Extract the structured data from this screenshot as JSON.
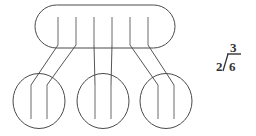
{
  "canvas": {
    "width": 256,
    "height": 136,
    "background_color": "#ffffff",
    "line_color": "#4a4a4a",
    "tally_color": "#6b6b6b",
    "text_color": "#333333"
  },
  "diagram": {
    "whole_group": {
      "shape": "stadium",
      "label": "whole-group",
      "tally_count": 6,
      "tally_marks": [
        "|",
        "|",
        "|",
        "|",
        "|",
        "|"
      ],
      "bounds": {
        "x": 35,
        "y": 5,
        "width": 140,
        "height": 43,
        "radius": 21.5
      },
      "tally_x_positions": [
        58,
        76,
        94,
        112,
        130,
        148
      ],
      "tally_y_top": 17,
      "tally_y_bottom": 45
    },
    "sub_groups": [
      {
        "label": "group-1",
        "shape": "circle",
        "tally_count": 2,
        "tally_marks": [
          "|",
          "|"
        ],
        "center_x": 39,
        "center_y": 101,
        "radius_x": 26,
        "radius_y": 27.5,
        "tally_x_positions": [
          31,
          47
        ],
        "tally_y_top": 85,
        "tally_y_bottom": 119
      },
      {
        "label": "group-2",
        "shape": "circle",
        "tally_count": 2,
        "tally_marks": [
          "|",
          "|"
        ],
        "center_x": 103,
        "center_y": 101,
        "radius_x": 26,
        "radius_y": 27.5,
        "tally_x_positions": [
          95,
          111
        ],
        "tally_y_top": 85,
        "tally_y_bottom": 119
      },
      {
        "label": "group-3",
        "shape": "circle",
        "tally_count": 2,
        "tally_marks": [
          "|",
          "|"
        ],
        "center_x": 166,
        "center_y": 101,
        "radius_x": 26,
        "radius_y": 27.5,
        "tally_x_positions": [
          158,
          174
        ],
        "tally_y_top": 85,
        "tally_y_bottom": 119
      }
    ],
    "connectors": [
      {
        "label": "connector-1",
        "from_x": 58,
        "from_y": 45,
        "to_x": 31,
        "to_y": 85
      },
      {
        "label": "connector-2",
        "from_x": 76,
        "from_y": 45,
        "to_x": 47,
        "to_y": 85
      },
      {
        "label": "connector-3",
        "from_x": 94,
        "from_y": 45,
        "to_x": 95,
        "to_y": 85
      },
      {
        "label": "connector-4",
        "from_x": 112,
        "from_y": 45,
        "to_x": 111,
        "to_y": 85
      },
      {
        "label": "connector-5",
        "from_x": 130,
        "from_y": 45,
        "to_x": 158,
        "to_y": 85
      },
      {
        "label": "connector-6",
        "from_x": 148,
        "from_y": 45,
        "to_x": 174,
        "to_y": 85
      }
    ]
  },
  "expression": {
    "notation": "long-division",
    "divisor": "2",
    "dividend": "6",
    "quotient": "3",
    "full_text": "3 over 2 into 6",
    "position": {
      "x": 214,
      "y": 48
    }
  }
}
